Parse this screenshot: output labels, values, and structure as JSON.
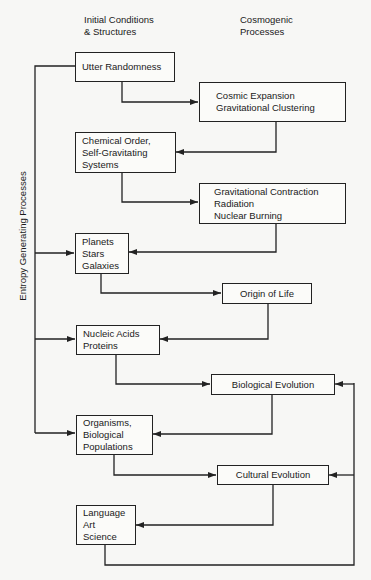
{
  "headings": {
    "left": "Initial Conditions\n& Structures",
    "right": "Cosmogenic\nProcesses"
  },
  "side_label": "Entropy Generating Processes",
  "structures": [
    {
      "id": "utter-randomness",
      "label": "Utter Randomness"
    },
    {
      "id": "chemical-order",
      "label": "Chemical Order,\nSelf-Gravitating\nSystems"
    },
    {
      "id": "planets",
      "label": "Planets\nStars\nGalaxies"
    },
    {
      "id": "nucleic-acids",
      "label": "Nucleic Acids\nProteins"
    },
    {
      "id": "organisms",
      "label": "Organisms,\nBiological\nPopulations"
    },
    {
      "id": "language",
      "label": "Language\nArt\nScience"
    }
  ],
  "processes": [
    {
      "id": "cosmic-expansion",
      "label": "Cosmic Expansion\nGravitational Clustering"
    },
    {
      "id": "gravitational-contraction",
      "label": "Gravitational Contraction\nRadiation\nNuclear Burning"
    },
    {
      "id": "origin-of-life",
      "label": "Origin of Life"
    },
    {
      "id": "biological-evolution",
      "label": "Biological Evolution"
    },
    {
      "id": "cultural-evolution",
      "label": "Cultural Evolution"
    }
  ],
  "colors": {
    "line": "#222222",
    "background": "#f7f7f5"
  }
}
